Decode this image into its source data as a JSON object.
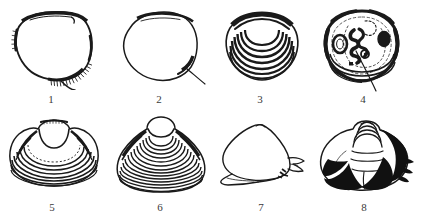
{
  "plate": {
    "title": "Shell specimen illustration plate",
    "style": "ink line drawing, black on white",
    "background_color": "#ffffff",
    "ink_color": "#1a1a1a",
    "rows": 2,
    "columns": 4,
    "figure_count": 8
  },
  "figures": [
    {
      "number": "1",
      "label": "1",
      "name": "specimen-1",
      "description": "Rounded sub-circular valve, open outline, flattened dorsal margin with heavy shading at upper left; dense hair-like fringe along ventral-right margin with a projecting spine",
      "shape": "sub-circular",
      "ornament": "smooth, marginal fringe",
      "row": 1,
      "column": 1
    },
    {
      "number": "2",
      "label": "2",
      "name": "specimen-2",
      "description": "Near circular valve with thin even outline, darkened straight dorsal margin and a short dark posterior process at lower right",
      "shape": "circular",
      "ornament": "smooth",
      "row": 1,
      "column": 2
    },
    {
      "number": "3",
      "label": "3",
      "name": "specimen-3",
      "description": "Broadly oval valve with heavy black dorsal band and seven strong nested concentric growth ribs spreading from the umbo",
      "shape": "broadly oval",
      "ornament": "concentric ribs",
      "rib_count": 7,
      "row": 1,
      "column": 3
    },
    {
      "number": "4",
      "label": "4",
      "name": "specimen-4",
      "description": "Rounded valve shown from interior; dark irregular margin, coiled and blotched internal muscle scars and pallial markings, fine concentric lines at base crossed by a diagonal stroke",
      "shape": "rounded",
      "ornament": "interior scars, concentric basal lines",
      "row": 1,
      "column": 4
    },
    {
      "number": "5",
      "label": "5",
      "name": "specimen-5",
      "description": "Wide trigonal valve with large open lunule/umbonal area, shaded flanks and about eight broad concentric growth ridges across the lower half",
      "shape": "trigonal, transverse",
      "ornament": "concentric ridges",
      "rib_count": 8,
      "row": 2,
      "column": 1
    },
    {
      "number": "6",
      "label": "6",
      "name": "specimen-6",
      "description": "Equilateral trigonal valve with rounded umbo and about fourteen closely spaced concentric growth rings, shaded antero- and postero-dorsal slopes",
      "shape": "equilaterally trigonal",
      "ornament": "dense concentric rings",
      "rib_count": 14,
      "row": 2,
      "column": 2
    },
    {
      "number": "7",
      "label": "7",
      "name": "specimen-7",
      "description": "Obliquely triangular smooth valve drawn in outline only, with a pointed apex, a narrow anterior wing at lower left and a notched posterior projection at right",
      "shape": "obliquely triangular",
      "ornament": "smooth outline",
      "row": 2,
      "column": 3
    },
    {
      "number": "8",
      "label": "8",
      "name": "specimen-8",
      "description": "Broad valve with spirally ribbed conical umbo, strong solid black colour patches forming radial blotches on the flanks and spiky dark projections on the right margin",
      "shape": "broadly ovate",
      "ornament": "spiral umbonal ribs, black colour blotches",
      "row": 2,
      "column": 4
    }
  ]
}
